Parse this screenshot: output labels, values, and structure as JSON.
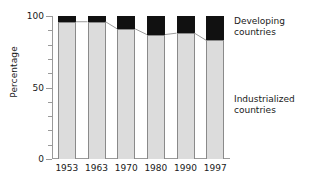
{
  "chart_data": {
    "type": "bar",
    "title": "",
    "subtitle": "",
    "xlabel": "",
    "ylabel": "Percentage",
    "categories": [
      "1953",
      "1963",
      "1970",
      "1980",
      "1990",
      "1997"
    ],
    "series": [
      {
        "name": "Industrialized countries",
        "values": [
          96,
          96,
          91,
          87,
          88,
          83
        ]
      },
      {
        "name": "Developing countries",
        "values": [
          4,
          4,
          9,
          13,
          12,
          17
        ]
      }
    ],
    "stacked": true,
    "ylim": [
      0,
      100
    ],
    "ytick_labels": [
      "0",
      "50",
      "100"
    ],
    "ytick_values": [
      0,
      50,
      100
    ],
    "yminor_step": 10,
    "grid": false,
    "legend_position": "right-annotations",
    "annotations": [
      {
        "id": "developing",
        "text": "Developing\ncountries",
        "color": "#111111"
      },
      {
        "id": "industrialized",
        "text": "Industrialized\ncountries",
        "color": "#dcdcdc"
      }
    ],
    "connector_line": true
  },
  "colors": {
    "developing": "#111111",
    "industrialized": "#dcdcdc",
    "bar_edge": "#8a8a8a",
    "axis": "#9a9a9a",
    "text": "#1a1a1a",
    "background": "#ffffff"
  }
}
